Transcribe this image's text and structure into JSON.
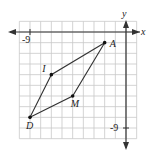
{
  "diagram": {
    "type": "coordinate-plane-quadrilateral",
    "axes": {
      "x_label": "x",
      "y_label": "y",
      "x_tick_label": "-9",
      "y_tick_label": "-9",
      "x_range": [
        -10,
        1
      ],
      "y_range": [
        -10,
        1
      ]
    },
    "colors": {
      "grid": "#c8c8c8",
      "axis": "#333333",
      "shape": "#333333",
      "point": "#111111"
    },
    "points": [
      {
        "name": "A",
        "x": -2,
        "y": -1
      },
      {
        "name": "I",
        "x": -7,
        "y": -4
      },
      {
        "name": "D",
        "x": -9,
        "y": -8
      },
      {
        "name": "M",
        "x": -5,
        "y": -6
      }
    ],
    "polygon_order": [
      "A",
      "I",
      "D",
      "M"
    ]
  }
}
